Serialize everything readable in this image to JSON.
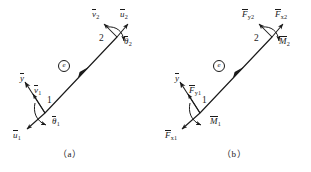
{
  "figure": {
    "type": "beam-element-local-coordinates",
    "panels": [
      {
        "id": "a",
        "caption": "(a)",
        "description": "Nodal displacements of a beam element in local coordinates",
        "element_tag": "e",
        "nodes": [
          {
            "number": "1",
            "labels": [
              {
                "name": "y-axis",
                "symbol": "y",
                "subscript": "",
                "overbar": true
              },
              {
                "name": "transverse-displacement-node1",
                "symbol": "v",
                "subscript": "1",
                "overbar": true
              },
              {
                "name": "rotation-node1",
                "symbol": "θ",
                "subscript": "1",
                "overbar": true
              },
              {
                "name": "axial-displacement-node1",
                "symbol": "u",
                "subscript": "1",
                "overbar": true
              }
            ]
          },
          {
            "number": "2",
            "labels": [
              {
                "name": "transverse-displacement-node2",
                "symbol": "v",
                "subscript": "2",
                "overbar": true
              },
              {
                "name": "axial-displacement-node2",
                "symbol": "u",
                "subscript": "2",
                "overbar": true
              },
              {
                "name": "rotation-node2",
                "symbol": "θ",
                "subscript": "2",
                "overbar": true
              }
            ]
          }
        ]
      },
      {
        "id": "b",
        "caption": "(b)",
        "description": "Nodal forces and moments of a beam element in local coordinates",
        "element_tag": "e",
        "nodes": [
          {
            "number": "1",
            "labels": [
              {
                "name": "y-axis",
                "symbol": "y",
                "subscript": "",
                "overbar": true
              },
              {
                "name": "shear-force-node1",
                "symbol": "F",
                "subscript": "y1",
                "overbar": true
              },
              {
                "name": "moment-node1",
                "symbol": "M",
                "subscript": "1",
                "overbar": true
              },
              {
                "name": "axial-force-node1",
                "symbol": "F",
                "subscript": "x1",
                "overbar": true
              }
            ]
          },
          {
            "number": "2",
            "labels": [
              {
                "name": "shear-force-node2",
                "symbol": "F",
                "subscript": "y2",
                "overbar": true
              },
              {
                "name": "axial-force-node2",
                "symbol": "F",
                "subscript": "x2",
                "overbar": true
              },
              {
                "name": "moment-node2",
                "symbol": "M",
                "subscript": "2",
                "overbar": true
              }
            ]
          }
        ]
      }
    ]
  },
  "labels": {
    "a_v2": "v",
    "a_v2_sub": "2",
    "a_u2": "u",
    "a_u2_sub": "2",
    "a_th2": "θ",
    "a_th2_sub": "2",
    "a_node2": "2",
    "a_y": "y",
    "a_v1": "v",
    "a_v1_sub": "1",
    "a_node1": "1",
    "a_th1": "θ",
    "a_th1_sub": "1",
    "a_u1": "u",
    "a_u1_sub": "1",
    "a_elem": "e",
    "a_caption": "（a）",
    "b_Fy2": "F",
    "b_Fy2_sub": "y2",
    "b_Fx2": "F",
    "b_Fx2_sub": "x2",
    "b_M2": "M",
    "b_M2_sub": "2",
    "b_node2": "2",
    "b_y": "y",
    "b_Fy1": "F",
    "b_Fy1_sub": "y1",
    "b_node1": "1",
    "b_M1": "M",
    "b_M1_sub": "1",
    "b_Fx1": "F",
    "b_Fx1_sub": "x1",
    "b_elem": "e",
    "b_caption": "（b）"
  },
  "colors": {
    "stroke": "#1a1a1a",
    "background": "#ffffff"
  },
  "geometry": {
    "panel_a": {
      "node1": [
        45,
        113
      ],
      "node2": [
        117,
        37
      ]
    },
    "panel_b": {
      "node1": [
        200,
        113
      ],
      "node2": [
        272,
        37
      ]
    }
  }
}
